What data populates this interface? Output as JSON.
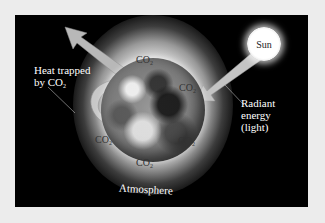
{
  "diagram": {
    "labels": {
      "sun": "Sun",
      "heat_trapped_line1": "Heat trapped",
      "heat_trapped_line2": "by CO",
      "radiant_line1": "Radiant",
      "radiant_line2": "energy",
      "radiant_line3": "(light)",
      "atmosphere": "Atmosphere"
    },
    "co2_labels": [
      {
        "text": "CO",
        "sub": "2",
        "position": "top"
      },
      {
        "text": "CO",
        "sub": "2",
        "position": "upper-right"
      },
      {
        "text": "CO",
        "sub": "2",
        "position": "lower-left"
      },
      {
        "text": "CO",
        "sub": "2",
        "position": "lower-right"
      },
      {
        "text": "CO",
        "sub": "2",
        "position": "bottom"
      }
    ],
    "subscript_2": "2",
    "colors": {
      "page_background": "#ececec",
      "frame_background": "#000000",
      "arrow_fill": "#bdbdbd",
      "label_text": "#ffffff",
      "co2_text": "#333333"
    }
  }
}
